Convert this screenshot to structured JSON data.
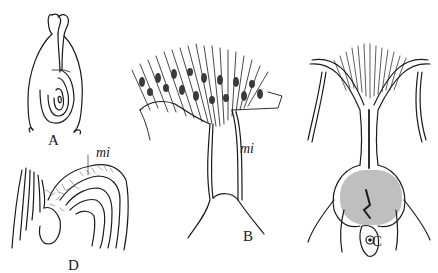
{
  "figure": {
    "panels": [
      {
        "id": "A",
        "label": "A",
        "description": "ovule-like body with two apical lobes and concentric inner layers"
      },
      {
        "id": "B",
        "label": "B",
        "description": "fan of elongated cells with nuclei atop a stalk",
        "annotation": "mi"
      },
      {
        "id": "C",
        "label": "C",
        "description": "branching structure with dense granular mass and cell below"
      },
      {
        "id": "D",
        "label": "D",
        "description": "curved concentric layers with fibrous tissue",
        "annotation": "mi"
      }
    ],
    "colors": {
      "ink": "#1a1a1a",
      "background": "#ffffff",
      "shade": "#8a8a8a"
    }
  }
}
